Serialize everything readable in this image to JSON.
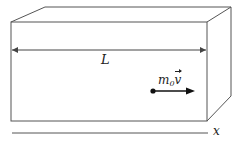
{
  "diagram": {
    "type": "3d-box-with-moving-particle",
    "labels": {
      "length": "L",
      "momentum_mass": "m",
      "momentum_subscript": "0",
      "momentum_vector": "v",
      "axis": "x"
    },
    "colors": {
      "stroke": "#444444",
      "particle": "#111111",
      "background": "#ffffff"
    }
  }
}
